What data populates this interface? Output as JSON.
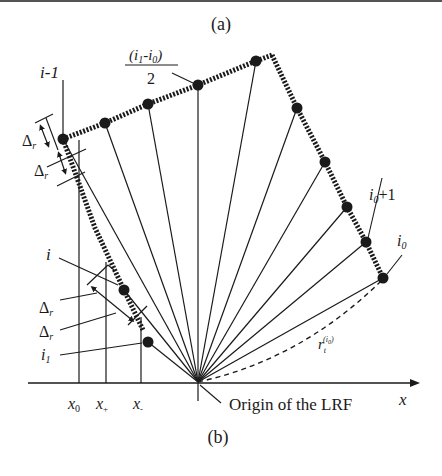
{
  "figure": {
    "panel_a_label": "(a)",
    "panel_b_label": "(b)"
  },
  "labels": {
    "i_minus_1": "i-1",
    "midpoint_num_open": "(",
    "midpoint_i1": "i",
    "midpoint_i1_sub": "1",
    "midpoint_minus": "-",
    "midpoint_i0": "i",
    "midpoint_i0_sub": "0",
    "midpoint_num_close": ")",
    "midpoint_den": "2",
    "delta": "Δ",
    "delta_sub": "r",
    "i": "i",
    "i1": "i",
    "i1_sub": "1",
    "i0_plus_1_base": "i",
    "i0_plus_1_sub": "0",
    "i0_plus_1_suffix": "+1",
    "i0": "i",
    "i0_sub": "0",
    "r_label": "r",
    "r_sub": "t",
    "r_sup": "(i",
    "r_sup_sub": "0",
    "r_sup_close": ")",
    "x0": "x",
    "x0_sub": "0",
    "xplus": "x",
    "xplus_sub": "+",
    "xminus": "x",
    "xminus_sub": "-",
    "x_axis": "x",
    "origin": "Origin of the LRF"
  },
  "colors": {
    "ink": "#1a1a1a",
    "background": "#ffffff"
  }
}
